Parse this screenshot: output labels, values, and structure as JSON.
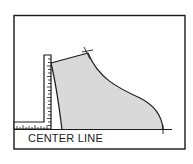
{
  "diagram": {
    "labels": {
      "center_line": "CENTER LINE"
    },
    "colors": {
      "stroke": "#1a1a1a",
      "fill": "#d9d9d9",
      "background": "#ffffff"
    },
    "elements": [
      {
        "name": "frame",
        "type": "rectangle"
      },
      {
        "name": "center-line",
        "type": "baseline"
      },
      {
        "name": "l-square-ruler",
        "type": "ruler"
      },
      {
        "name": "pattern-piece",
        "type": "shaded-shape"
      },
      {
        "name": "shoulder-mark",
        "type": "cross-mark"
      },
      {
        "name": "hem-mark",
        "type": "cross-mark"
      }
    ]
  }
}
